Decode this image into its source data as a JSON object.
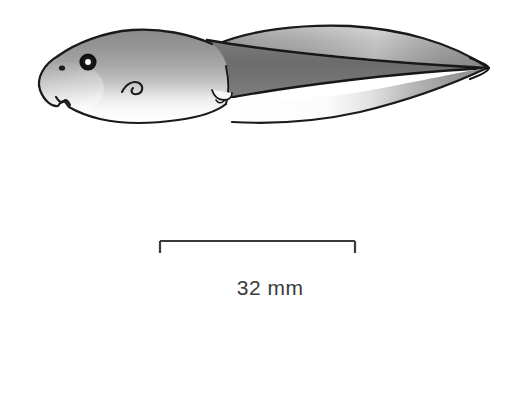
{
  "figure": {
    "name": "tadpole-lateral-view-illustration",
    "background_color": "#ffffff",
    "width": 517,
    "height": 408,
    "view": "lateral",
    "style": "grayscale line drawing with airbrush shading"
  },
  "illustration": {
    "outline_color": "#1a1a1a",
    "outline_width": 2.1,
    "shading": {
      "body_dark": "#8d8d8d",
      "body_mid": "#b0b0b0",
      "body_light": "#f2f2f2",
      "tail_muscle_dark": "#6e6e6e",
      "tail_fin_mid": "#9a9a9a",
      "highlight": "#ffffff"
    },
    "parts": [
      {
        "name": "head-body-mass",
        "label": "head and body"
      },
      {
        "name": "eye",
        "label": "eye"
      },
      {
        "name": "eye-highlight",
        "label": "pupil highlight"
      },
      {
        "name": "nostril",
        "label": "nostril"
      },
      {
        "name": "spiracle",
        "label": "spiracle"
      },
      {
        "name": "oral-disc",
        "label": "oral disc"
      },
      {
        "name": "vent-tube",
        "label": "vent tube"
      },
      {
        "name": "tail-musculature",
        "label": "tail musculature"
      },
      {
        "name": "dorsal-fin",
        "label": "dorsal fin"
      },
      {
        "name": "ventral-fin",
        "label": "ventral fin"
      },
      {
        "name": "tail-tip",
        "label": "tail tip"
      }
    ]
  },
  "scale_bar": {
    "label": "32 mm",
    "value": 32,
    "unit": "mm",
    "left_x": 160,
    "right_x": 355,
    "bar_y": 241,
    "tick_height": 12,
    "line_color": "#3a3a3a",
    "line_width": 2.2,
    "label_color": "#3a3a3a"
  }
}
